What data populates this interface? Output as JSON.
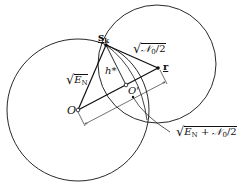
{
  "diagram": {
    "type": "geometric",
    "colors": {
      "stroke": "#111111",
      "background": "#ffffff"
    },
    "points": {
      "sk": {
        "label": "s",
        "label_sub": "k",
        "x": 106,
        "y": 45
      },
      "r": {
        "label": "r",
        "x": 158,
        "y": 68
      },
      "O": {
        "label": "O",
        "x": 78,
        "y": 110
      },
      "O_prime": {
        "label": "O'",
        "x": 126,
        "y": 85
      }
    },
    "circles": [
      {
        "name": "large-circle",
        "cx": 78,
        "cy": 110,
        "r": 71
      },
      {
        "name": "small-circle",
        "cx": 157,
        "cy": 64,
        "r": 59
      }
    ],
    "labels": {
      "sk_main": "s",
      "sk_sub": "k",
      "r": "r",
      "O": "O",
      "O_prime": "O'",
      "h_star": "h*",
      "sqrt_EN_E": "E",
      "sqrt_EN_sub": "N",
      "sqrt_N0_main": "𝒩",
      "sqrt_N0_rest": "/2",
      "sqrt_N0_sub": "0",
      "sum_E": "E",
      "sum_sub_N": "N",
      "sum_plus": " + ",
      "sum_N": "𝒩",
      "sum_sub_0": "0",
      "sum_rest": "/2",
      "radical": "√"
    }
  }
}
